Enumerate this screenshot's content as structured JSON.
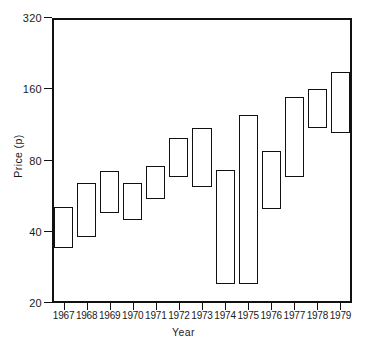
{
  "chart_data": {
    "type": "bar",
    "subtype": "high-low-range-bar",
    "title": "",
    "xlabel": "Year",
    "ylabel": "Price (p)",
    "categories": [
      "1967",
      "1968",
      "1969",
      "1970",
      "1971",
      "1972",
      "1973",
      "1974",
      "1975",
      "1976",
      "1977",
      "1978",
      "1979"
    ],
    "yscale": "log",
    "ylim": [
      20,
      320
    ],
    "yticks": [
      20,
      40,
      80,
      160,
      320
    ],
    "ytick_labels": [
      "20",
      "40",
      "80",
      "160",
      "320"
    ],
    "grid": false,
    "legend": null,
    "series": [
      {
        "name": "High",
        "values": [
          51,
          64,
          72,
          64,
          76,
          100,
          110,
          73,
          124,
          88,
          148,
          160,
          190
        ]
      },
      {
        "name": "Low",
        "values": [
          34,
          38,
          48,
          45,
          55,
          68,
          62,
          24,
          24,
          50,
          68,
          110,
          105
        ]
      }
    ],
    "bars": [
      {
        "category": "1967",
        "low": 34,
        "high": 51
      },
      {
        "category": "1968",
        "low": 38,
        "high": 64
      },
      {
        "category": "1969",
        "low": 48,
        "high": 72
      },
      {
        "category": "1970",
        "low": 45,
        "high": 64
      },
      {
        "category": "1971",
        "low": 55,
        "high": 76
      },
      {
        "category": "1972",
        "low": 68,
        "high": 100
      },
      {
        "category": "1973",
        "low": 62,
        "high": 110
      },
      {
        "category": "1974",
        "low": 24,
        "high": 73
      },
      {
        "category": "1975",
        "low": 24,
        "high": 124
      },
      {
        "category": "1976",
        "low": 50,
        "high": 88
      },
      {
        "category": "1977",
        "low": 68,
        "high": 148
      },
      {
        "category": "1978",
        "low": 110,
        "high": 160
      },
      {
        "category": "1979",
        "low": 105,
        "high": 190
      }
    ]
  },
  "colors": {
    "axis": "#111111",
    "bar_stroke": "#111111",
    "bar_fill": "transparent",
    "background": "#ffffff"
  }
}
